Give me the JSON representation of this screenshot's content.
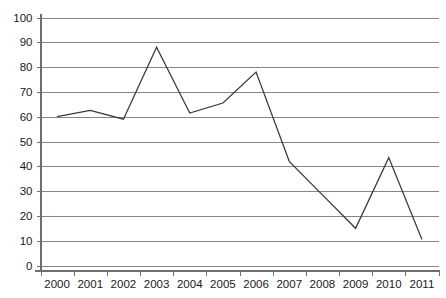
{
  "chart_data": {
    "type": "line",
    "title": "",
    "subtitle": "",
    "xlabel": "",
    "ylabel": "",
    "categories": [
      "2000",
      "2001",
      "2002",
      "2003",
      "2004",
      "2005",
      "2006",
      "2007",
      "2008",
      "2009",
      "2010",
      "2011"
    ],
    "values": [
      60,
      62.5,
      59,
      88,
      61.5,
      65.5,
      78,
      42,
      28.5,
      15,
      43.5,
      10.5
    ],
    "series": [
      {
        "name": "",
        "values": [
          60,
          62.5,
          59,
          88,
          61.5,
          65.5,
          78,
          42,
          28.5,
          15,
          43.5,
          10.5
        ]
      }
    ],
    "ylim": [
      0,
      100
    ],
    "ytick_labels": [
      "0",
      "10",
      "20",
      "30",
      "40",
      "50",
      "60",
      "70",
      "80",
      "90",
      "100"
    ],
    "ytick_values": [
      0,
      10,
      20,
      30,
      40,
      50,
      60,
      70,
      80,
      90,
      100
    ],
    "grid": true,
    "grid_axis": "y",
    "legend": false,
    "legend_position": "none",
    "markers": false,
    "line_color": "#3a3a3a",
    "grid_color": "#868686",
    "axis_color": "#6e6e6e",
    "background_color": "#ffffff",
    "text_color": "#1a1a1a"
  }
}
